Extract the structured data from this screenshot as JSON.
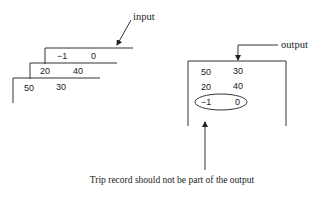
{
  "diagram": {
    "input_label": "input",
    "output_label": "output",
    "caption": "Trip record should not be part of the output",
    "input_stack": [
      {
        "a": "−1",
        "b": "0"
      },
      {
        "a": "20",
        "b": "40"
      },
      {
        "a": "50",
        "b": "30"
      }
    ],
    "output_rows": [
      {
        "a": "50",
        "b": "30"
      },
      {
        "a": "20",
        "b": "40"
      },
      {
        "a": "−1",
        "b": "0"
      }
    ],
    "highlighted_output_row": 2
  }
}
